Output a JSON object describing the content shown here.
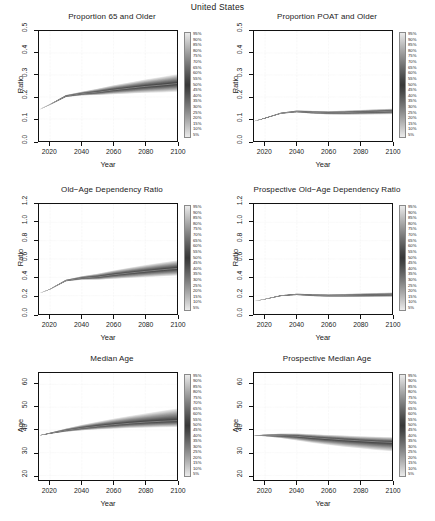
{
  "figure": {
    "main_title": "United States",
    "legend_labels": [
      "95%",
      "90%",
      "85%",
      "80%",
      "75%",
      "70%",
      "65%",
      "60%",
      "55%",
      "50%",
      "45%",
      "40%",
      "35%",
      "30%",
      "25%",
      "20%",
      "15%",
      "10%",
      "5%"
    ],
    "legend_name": "probability-interval-gradient"
  },
  "chart_data": [
    {
      "type": "area",
      "id": "proportion-65-and-older",
      "title": "Proportion 65 and Older",
      "xlabel": "Year",
      "ylabel": "Ratio",
      "xlim": [
        2013,
        2100
      ],
      "ylim": [
        0.0,
        0.5
      ],
      "xticks": [
        2020,
        2040,
        2060,
        2080,
        2100
      ],
      "yticks": [
        "0.0",
        "0.1",
        "0.2",
        "0.3",
        "0.4",
        "0.5"
      ],
      "grid": true,
      "x": [
        2013,
        2020,
        2030,
        2040,
        2050,
        2060,
        2070,
        2080,
        2090,
        2100
      ],
      "series": [
        {
          "name": "median",
          "values": [
            0.142,
            0.166,
            0.204,
            0.215,
            0.222,
            0.232,
            0.24,
            0.248,
            0.254,
            0.261
          ]
        },
        {
          "name": "p5",
          "values": [
            0.142,
            0.165,
            0.2,
            0.207,
            0.209,
            0.213,
            0.216,
            0.219,
            0.221,
            0.224
          ]
        },
        {
          "name": "p95",
          "values": [
            0.142,
            0.167,
            0.209,
            0.224,
            0.238,
            0.253,
            0.266,
            0.279,
            0.291,
            0.303
          ]
        }
      ]
    },
    {
      "type": "area",
      "id": "proportion-poat-and-older",
      "title": "Proportion POAT and Older",
      "xlabel": "Year",
      "ylabel": "Ratio",
      "xlim": [
        2013,
        2100
      ],
      "ylim": [
        0.0,
        0.5
      ],
      "xticks": [
        2020,
        2040,
        2060,
        2080,
        2100
      ],
      "yticks": [
        "0.0",
        "0.1",
        "0.2",
        "0.3",
        "0.4",
        "0.5"
      ],
      "grid": true,
      "x": [
        2013,
        2020,
        2030,
        2040,
        2050,
        2060,
        2070,
        2080,
        2090,
        2100
      ],
      "series": [
        {
          "name": "median",
          "values": [
            0.09,
            0.104,
            0.126,
            0.134,
            0.13,
            0.128,
            0.129,
            0.131,
            0.133,
            0.135
          ]
        },
        {
          "name": "p5",
          "values": [
            0.09,
            0.103,
            0.124,
            0.13,
            0.124,
            0.121,
            0.12,
            0.12,
            0.121,
            0.122
          ]
        },
        {
          "name": "p95",
          "values": [
            0.09,
            0.105,
            0.129,
            0.139,
            0.137,
            0.136,
            0.138,
            0.141,
            0.144,
            0.147
          ]
        }
      ]
    },
    {
      "type": "area",
      "id": "old-age-dependency-ratio",
      "title": "Old−Age Dependency Ratio",
      "xlabel": "Year",
      "ylabel": "Ratio",
      "xlim": [
        2013,
        2100
      ],
      "ylim": [
        0.0,
        1.2
      ],
      "xticks": [
        2020,
        2040,
        2060,
        2080,
        2100
      ],
      "yticks": [
        "0.0",
        "0.2",
        "0.4",
        "0.6",
        "0.8",
        "1.0",
        "1.2"
      ],
      "grid": true,
      "x": [
        2013,
        2020,
        2030,
        2040,
        2050,
        2060,
        2070,
        2080,
        2090,
        2100
      ],
      "series": [
        {
          "name": "median",
          "values": [
            0.225,
            0.272,
            0.365,
            0.392,
            0.405,
            0.428,
            0.447,
            0.465,
            0.482,
            0.497
          ]
        },
        {
          "name": "p5",
          "values": [
            0.225,
            0.27,
            0.357,
            0.374,
            0.374,
            0.384,
            0.393,
            0.402,
            0.411,
            0.419
          ]
        },
        {
          "name": "p95",
          "values": [
            0.225,
            0.274,
            0.374,
            0.412,
            0.44,
            0.475,
            0.505,
            0.534,
            0.56,
            0.585
          ]
        }
      ]
    },
    {
      "type": "area",
      "id": "prospective-old-age-dependency-ratio",
      "title": "Prospective Old−Age Dependency Ratio",
      "xlabel": "Year",
      "ylabel": "Ratio",
      "xlim": [
        2013,
        2100
      ],
      "ylim": [
        0.0,
        1.2
      ],
      "xticks": [
        2020,
        2040,
        2060,
        2080,
        2100
      ],
      "yticks": [
        "0.0",
        "0.2",
        "0.4",
        "0.6",
        "0.8",
        "1.0",
        "1.2"
      ],
      "grid": true,
      "x": [
        2013,
        2020,
        2030,
        2040,
        2050,
        2060,
        2070,
        2080,
        2090,
        2100
      ],
      "series": [
        {
          "name": "median",
          "values": [
            0.14,
            0.163,
            0.2,
            0.214,
            0.205,
            0.201,
            0.202,
            0.205,
            0.208,
            0.211
          ]
        },
        {
          "name": "p5",
          "values": [
            0.14,
            0.161,
            0.195,
            0.206,
            0.194,
            0.188,
            0.186,
            0.186,
            0.187,
            0.188
          ]
        },
        {
          "name": "p95",
          "values": [
            0.14,
            0.165,
            0.205,
            0.222,
            0.217,
            0.215,
            0.219,
            0.224,
            0.229,
            0.234
          ]
        }
      ]
    },
    {
      "type": "area",
      "id": "median-age",
      "title": "Median Age",
      "xlabel": "Year",
      "ylabel": "Age",
      "xlim": [
        2013,
        2100
      ],
      "ylim": [
        18,
        65
      ],
      "xticks": [
        2020,
        2040,
        2060,
        2080,
        2100
      ],
      "yticks": [
        "20",
        "30",
        "40",
        "50",
        "60"
      ],
      "grid": true,
      "x": [
        2013,
        2020,
        2030,
        2040,
        2050,
        2060,
        2070,
        2080,
        2090,
        2100
      ],
      "series": [
        {
          "name": "median",
          "values": [
            37.6,
            38.5,
            39.8,
            40.8,
            41.6,
            42.3,
            42.9,
            43.4,
            43.8,
            44.1
          ]
        },
        {
          "name": "p5",
          "values": [
            37.6,
            38.3,
            39.2,
            39.8,
            40.2,
            40.5,
            40.8,
            41.0,
            41.2,
            41.3
          ]
        },
        {
          "name": "p95",
          "values": [
            37.6,
            38.8,
            40.6,
            42.2,
            43.6,
            44.9,
            46.1,
            47.2,
            48.3,
            49.4
          ]
        }
      ]
    },
    {
      "type": "area",
      "id": "prospective-median-age",
      "title": "Prospective Median Age",
      "xlabel": "Year",
      "ylabel": "Age",
      "xlim": [
        2013,
        2100
      ],
      "ylim": [
        18,
        65
      ],
      "xticks": [
        2020,
        2040,
        2060,
        2080,
        2100
      ],
      "yticks": [
        "20",
        "30",
        "40",
        "50",
        "60"
      ],
      "grid": true,
      "x": [
        2013,
        2020,
        2030,
        2040,
        2050,
        2060,
        2070,
        2080,
        2090,
        2100
      ],
      "series": [
        {
          "name": "median",
          "values": [
            37.5,
            37.6,
            37.5,
            37.2,
            36.6,
            36.1,
            35.6,
            35.2,
            34.8,
            34.5
          ]
        },
        {
          "name": "p5",
          "values": [
            37.5,
            37.2,
            36.4,
            35.4,
            34.3,
            33.4,
            32.6,
            31.9,
            31.2,
            30.6
          ]
        },
        {
          "name": "p95",
          "values": [
            37.5,
            38.0,
            38.4,
            38.4,
            38.1,
            37.8,
            37.5,
            37.2,
            37.0,
            36.8
          ]
        }
      ]
    }
  ]
}
